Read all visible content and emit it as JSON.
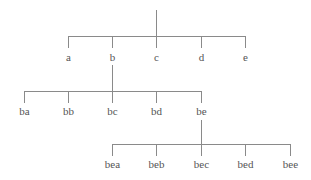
{
  "diagram": {
    "type": "tree",
    "line_color": "#8a8a8a",
    "text_color": "#555555",
    "root": {
      "label": "",
      "x": 156,
      "stem_top": 10,
      "bar_y": 36,
      "children_level": 0
    },
    "levels": [
      {
        "parent_x": 156,
        "parent_stem_top": 10,
        "bar_y": 36,
        "tick_bottom": 48,
        "label_y": 57,
        "nodes": [
          {
            "label": "a",
            "x": 68
          },
          {
            "label": "b",
            "x": 112
          },
          {
            "label": "c",
            "x": 156
          },
          {
            "label": "d",
            "x": 201
          },
          {
            "label": "e",
            "x": 245
          }
        ]
      },
      {
        "parent_x": 112,
        "parent_stem_top": 65,
        "bar_y": 91,
        "tick_bottom": 103,
        "label_y": 111,
        "nodes": [
          {
            "label": "ba",
            "x": 24
          },
          {
            "label": "bb",
            "x": 68
          },
          {
            "label": "bc",
            "x": 112
          },
          {
            "label": "bd",
            "x": 156
          },
          {
            "label": "be",
            "x": 201
          }
        ]
      },
      {
        "parent_x": 201,
        "parent_stem_top": 120,
        "bar_y": 144,
        "tick_bottom": 156,
        "label_y": 164,
        "nodes": [
          {
            "label": "bea",
            "x": 112
          },
          {
            "label": "beb",
            "x": 156
          },
          {
            "label": "bec",
            "x": 201
          },
          {
            "label": "bed",
            "x": 245
          },
          {
            "label": "bee",
            "x": 290
          }
        ]
      }
    ]
  }
}
